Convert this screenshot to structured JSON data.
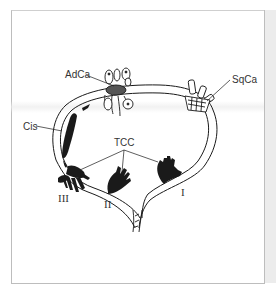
{
  "figure": {
    "type": "bladder-tumor-diagram",
    "labels": {
      "adca": "AdCa",
      "sqca": "SqCa",
      "cis": "Cis",
      "tcc": "TCC"
    },
    "stages": {
      "stage_1": "I",
      "stage_2": "II",
      "stage_3": "III"
    },
    "colors": {
      "ink": "#1a1a1a",
      "frame": "#bdbdbd",
      "strip": "#ececec",
      "background": "#ffffff"
    }
  }
}
